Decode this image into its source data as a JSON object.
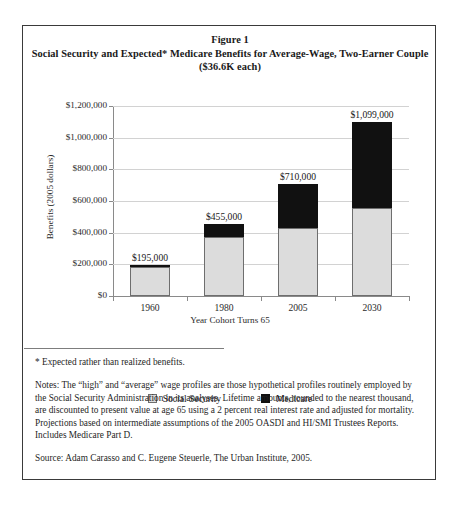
{
  "figure": {
    "label": "Figure 1",
    "title_line1": "Social Security and Expected* Medicare Benefits for Average-Wage, Two-Earner Couple",
    "title_line2": "($36.6K each)"
  },
  "notes": {
    "asterisk": "* Expected rather than realized benefits.",
    "body": "Notes: The “high” and “average” wage profiles are those hypothetical profiles routinely employed by the Social Security Administration in its analyses. Lifetime amounts, rounded to the nearest thousand, are discounted to present value at age 65 using a 2 percent real interest rate and adjusted for mortality. Projections based on intermediate assumptions of the 2005 OASDI and HI/SMI Trustees Reports. Includes Medicare Part D.",
    "source": "Source: Adam Carasso and C. Eugene Steuerle, The Urban Institute, 2005."
  },
  "chart_data": {
    "type": "bar",
    "stacked": true,
    "title": "Social Security and Expected* Medicare Benefits for Average-Wage, Two-Earner Couple ($36.6K each)",
    "xlabel": "Year Cohort Turns 65",
    "ylabel": "Benefits (2005 dollars)",
    "categories": [
      "1960",
      "1980",
      "2005",
      "2030"
    ],
    "series": [
      {
        "name": "Social Security",
        "color": "#dcdcdc",
        "values": [
          186000,
          372000,
          430000,
          555000
        ]
      },
      {
        "name": "Medicare",
        "color": "#111111",
        "values": [
          9000,
          83000,
          280000,
          544000
        ]
      }
    ],
    "totals": [
      195000,
      455000,
      710000,
      1099000
    ],
    "total_labels": [
      "$195,000",
      "$455,000",
      "$710,000",
      "$1,099,000"
    ],
    "ylim": [
      0,
      1200000
    ],
    "ytick_values": [
      0,
      200000,
      400000,
      600000,
      800000,
      1000000,
      1200000
    ],
    "ytick_labels": [
      "$0",
      "$200,000",
      "$400,000",
      "$600,000",
      "$800,000",
      "$1,000,000",
      "$1,200,000"
    ],
    "grid": true,
    "legend_position": "bottom"
  }
}
